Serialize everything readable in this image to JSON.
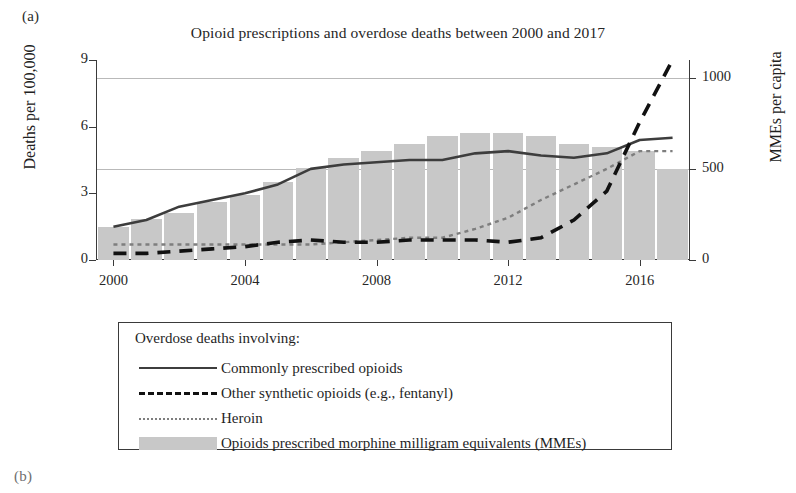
{
  "panel": {
    "a_label": "(a)",
    "b_label": "(b)"
  },
  "axis_titles": {
    "left": "Deaths per 100,000",
    "right": "MMEs per capita"
  },
  "legend": {
    "title": "Overdose deaths involving:",
    "items": [
      {
        "label": "Commonly prescribed opioids",
        "key": "solid-line-key",
        "color": "#3d3d3d"
      },
      {
        "label": "Other synthetic opioids (e.g., fentanyl)",
        "key": "dashed-line-key",
        "color": "#111111"
      },
      {
        "label": "Heroin",
        "key": "dotted-line-key",
        "color": "#7e7e7e"
      },
      {
        "label": "Opioids prescribed morphine milligram equivalents (MMEs)",
        "key": "bar-swatch-key",
        "color": "#c8c8c8"
      }
    ]
  },
  "chart_data": {
    "type": "bar",
    "title": "Opioid prescriptions and overdose deaths between 2000 and 2017",
    "xlabel": "",
    "ylabel": "Deaths per 100,000",
    "y2label": "MMEs per capita",
    "xlim": [
      1999.5,
      2017.5
    ],
    "ylim": [
      0,
      9
    ],
    "y2lim": [
      0,
      1100
    ],
    "yticks": [
      0,
      3,
      6,
      9
    ],
    "y2ticks": [
      0,
      500,
      1000
    ],
    "xticks": [
      2000,
      2004,
      2008,
      2012,
      2016
    ],
    "grid": "horizontal gridlines at MMEs 500 and 1000",
    "legend_position": "below plot, boxed",
    "x": [
      2000,
      2001,
      2002,
      2003,
      2004,
      2005,
      2006,
      2007,
      2008,
      2009,
      2010,
      2011,
      2012,
      2013,
      2014,
      2015,
      2016,
      2017
    ],
    "series": [
      {
        "name": "Opioids prescribed morphine milligram equivalents (MMEs)",
        "type": "bar",
        "axis": "right",
        "unit": "MMEs per capita",
        "color": "#c8c8c8",
        "values": [
          180,
          225,
          260,
          320,
          360,
          430,
          505,
          560,
          600,
          640,
          680,
          700,
          700,
          680,
          640,
          620,
          600,
          500
        ]
      },
      {
        "name": "Commonly prescribed opioids",
        "type": "line",
        "style": "solid",
        "axis": "left",
        "unit": "deaths per 100,000",
        "color": "#3d3d3d",
        "values": [
          1.5,
          1.8,
          2.4,
          2.7,
          3.0,
          3.4,
          4.1,
          4.3,
          4.4,
          4.5,
          4.5,
          4.8,
          4.9,
          4.7,
          4.6,
          4.8,
          5.4,
          5.5
        ]
      },
      {
        "name": "Other synthetic opioids (e.g., fentanyl)",
        "type": "line",
        "style": "dashed",
        "axis": "left",
        "unit": "deaths per 100,000",
        "color": "#111111",
        "values": [
          0.3,
          0.3,
          0.4,
          0.5,
          0.6,
          0.8,
          0.9,
          0.8,
          0.8,
          0.9,
          0.9,
          0.9,
          0.8,
          1.0,
          1.8,
          3.1,
          6.2,
          9.0
        ]
      },
      {
        "name": "Heroin",
        "type": "line",
        "style": "dotted",
        "axis": "left",
        "unit": "deaths per 100,000",
        "color": "#7e7e7e",
        "values": [
          0.7,
          0.7,
          0.7,
          0.7,
          0.7,
          0.7,
          0.7,
          0.8,
          0.9,
          1.0,
          1.0,
          1.4,
          1.9,
          2.7,
          3.4,
          4.1,
          4.9,
          4.9
        ]
      }
    ]
  }
}
